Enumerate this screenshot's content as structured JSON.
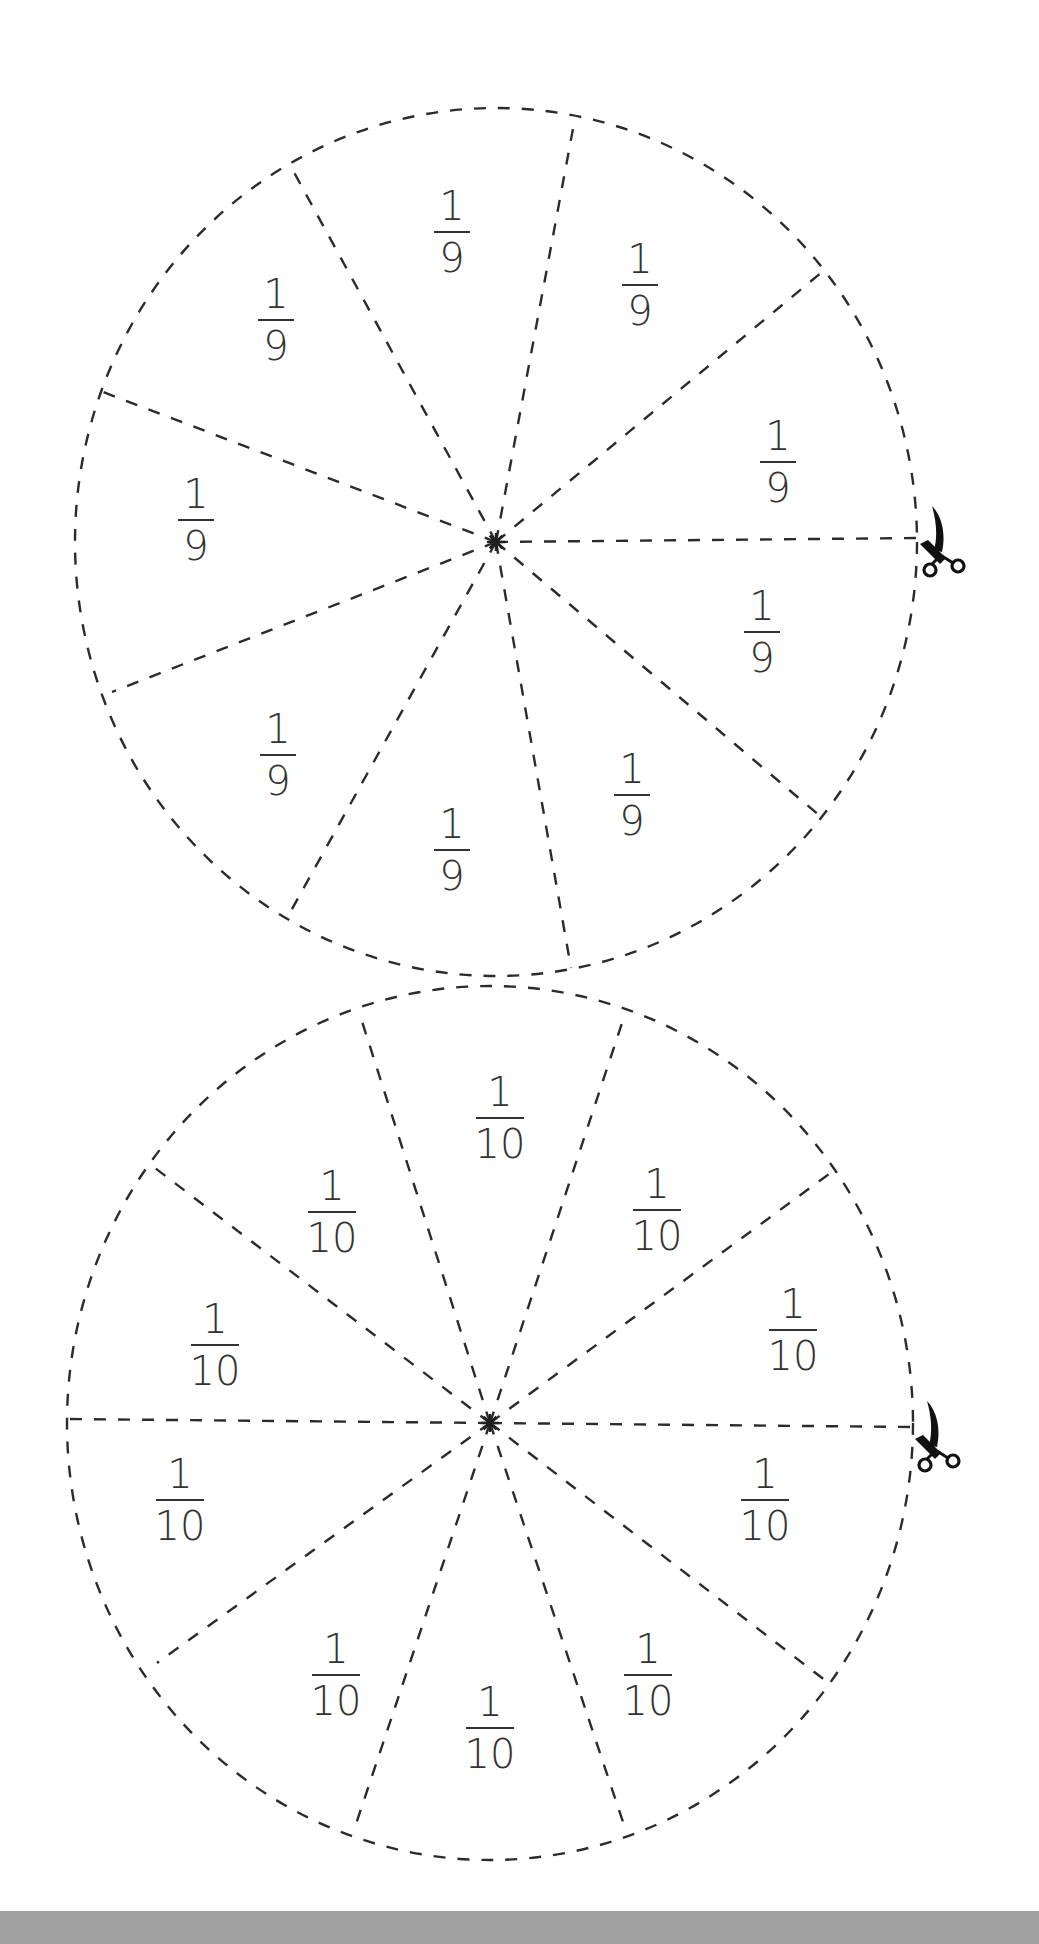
{
  "worksheet": {
    "title": "",
    "circles": [
      {
        "id": "ninths",
        "parts": 9,
        "center": [
          496,
          542
        ],
        "rx": 421,
        "ry": 434,
        "fraction": {
          "numerator": "1",
          "denominator": "9"
        },
        "spoke_ends": [
          [
            918,
            538
          ],
          [
            822,
            272
          ],
          [
            575,
            118
          ],
          [
            290,
            165
          ],
          [
            103,
            392
          ],
          [
            112,
            692
          ],
          [
            287,
            918
          ],
          [
            571,
            968
          ],
          [
            820,
            816
          ]
        ],
        "label_positions": [
          [
            778,
            462
          ],
          [
            640,
            285
          ],
          [
            452,
            232
          ],
          [
            276,
            320
          ],
          [
            196,
            520
          ],
          [
            278,
            755
          ],
          [
            452,
            850
          ],
          [
            632,
            795
          ],
          [
            762,
            632
          ]
        ],
        "scissors_position": [
          940,
          540
        ]
      },
      {
        "id": "tenths",
        "parts": 10,
        "center": [
          490,
          1423
        ],
        "rx": 423,
        "ry": 437,
        "fraction": {
          "numerator": "1",
          "denominator": "10"
        },
        "spoke_ends": [
          [
            913,
            1427
          ],
          [
            829,
            1174
          ],
          [
            625,
            1014
          ],
          [
            359,
            1012
          ],
          [
            155,
            1168
          ],
          [
            67,
            1419
          ],
          [
            157,
            1663
          ],
          [
            354,
            1830
          ],
          [
            626,
            1831
          ],
          [
            826,
            1681
          ]
        ],
        "label_positions": [
          [
            793,
            1330
          ],
          [
            657,
            1210
          ],
          [
            500,
            1118
          ],
          [
            332,
            1212
          ],
          [
            215,
            1345
          ],
          [
            180,
            1500
          ],
          [
            336,
            1675
          ],
          [
            490,
            1728
          ],
          [
            648,
            1675
          ],
          [
            765,
            1500
          ]
        ],
        "scissors_position": [
          935,
          1435
        ]
      }
    ],
    "labels": {
      "ninths": [
        "1/9",
        "1/9",
        "1/9",
        "1/9",
        "1/9",
        "1/9",
        "1/9",
        "1/9",
        "1/9"
      ],
      "tenths": [
        "1/10",
        "1/10",
        "1/10",
        "1/10",
        "1/10",
        "1/10",
        "1/10",
        "1/10",
        "1/10",
        "1/10"
      ]
    },
    "icons": {
      "cut_marker": "scissors-icon",
      "center_marker": "asterisk-center-icon"
    },
    "colors": {
      "line": "#2b2b2b",
      "text": "#333333",
      "footer": "#a0a0a0",
      "background": "#ffffff"
    }
  }
}
